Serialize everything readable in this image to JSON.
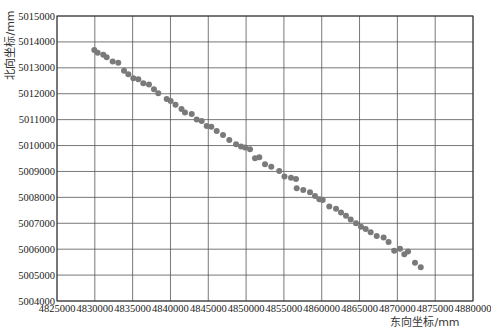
{
  "chart_data": {
    "type": "scatter",
    "title": "",
    "xlabel": "东向坐标/mm",
    "ylabel": "北向坐标/mm",
    "xlim": [
      4825000,
      4880000
    ],
    "ylim": [
      5004000,
      5015000
    ],
    "xticks": [
      4825000,
      4830000,
      4835000,
      4840000,
      4845000,
      4850000,
      4855000,
      4860000,
      4865000,
      4870000,
      4875000,
      4880000
    ],
    "yticks": [
      5004000,
      5005000,
      5006000,
      5007000,
      5008000,
      5009000,
      5010000,
      5011000,
      5012000,
      5013000,
      5014000,
      5015000
    ],
    "grid": true,
    "legend": null,
    "marker_color": "#7a7a7a",
    "series": [
      {
        "name": "points",
        "x": [
          4829930,
          4830380,
          4831120,
          4831570,
          4832360,
          4833100,
          4833860,
          4834430,
          4835090,
          4835750,
          4836410,
          4837160,
          4837820,
          4838390,
          4839500,
          4840030,
          4840670,
          4841460,
          4841920,
          4842810,
          4843470,
          4844130,
          4844790,
          4845400,
          4846110,
          4846950,
          4847780,
          4848670,
          4849330,
          4849860,
          4850520,
          4851180,
          4851750,
          4852500,
          4853330,
          4854380,
          4855080,
          4855940,
          4856600,
          4856690,
          4857560,
          4858450,
          4859110,
          4859680,
          4860130,
          4861000,
          4861890,
          4862550,
          4863210,
          4863830,
          4864530,
          4865190,
          4865810,
          4866470,
          4867270,
          4868180,
          4868840,
          4869580,
          4870350,
          4870920,
          4871410,
          4872330,
          4873090
        ],
        "y": [
          5013690,
          5013580,
          5013500,
          5013410,
          5013240,
          5013200,
          5012890,
          5012750,
          5012600,
          5012560,
          5012400,
          5012360,
          5012170,
          5012020,
          5011800,
          5011720,
          5011570,
          5011410,
          5011280,
          5011220,
          5011010,
          5010950,
          5010750,
          5010730,
          5010560,
          5010410,
          5010210,
          5010050,
          5009960,
          5009920,
          5009860,
          5009510,
          5009550,
          5009280,
          5009180,
          5009020,
          5008810,
          5008760,
          5008710,
          5008350,
          5008280,
          5008200,
          5008050,
          5007930,
          5007900,
          5007650,
          5007560,
          5007420,
          5007290,
          5007150,
          5007000,
          5006870,
          5006780,
          5006650,
          5006510,
          5006450,
          5006280,
          5005940,
          5006020,
          5005800,
          5005910,
          5005480,
          5005300
        ]
      }
    ]
  }
}
